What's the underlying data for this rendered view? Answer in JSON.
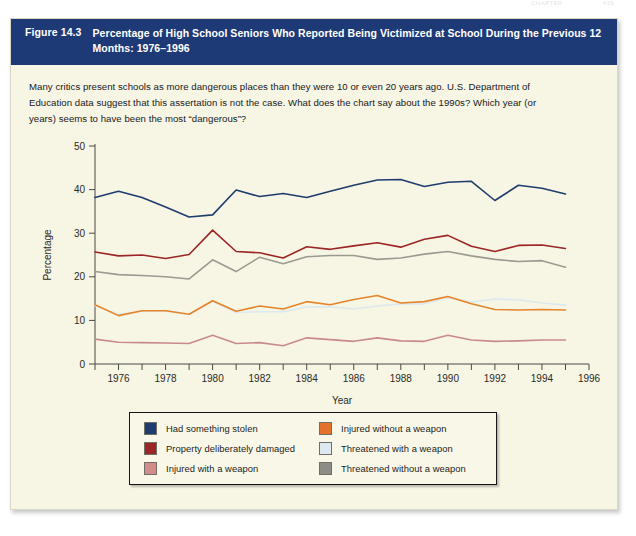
{
  "running_head": {
    "left_text": "CHAPTER",
    "right_text": "435"
  },
  "figure": {
    "number": "Figure 14.3",
    "title": "Percentage of High School Seniors Who Reported Being Victimized at School During the Previous 12 Months: 1976–1996",
    "caption": "Many critics present schools as more dangerous places than they were 10 or even 20 years ago. U.S. Department of Education data suggest that this assertation is not the case. What does the chart say about the 1990s? Which year (or years) seems to have been the most “dangerous”?",
    "header_bg": "#1d3a77",
    "page_bg": "#f7f5e4"
  },
  "chart_data": {
    "type": "line",
    "title": "Percentage of High School Seniors Who Reported Being Victimized at School During the Previous 12 Months: 1976–1996",
    "xlabel": "Year",
    "ylabel": "Percentage",
    "xlim": [
      1975,
      1996
    ],
    "ylim": [
      0,
      50
    ],
    "yticks": [
      0,
      10,
      20,
      30,
      40,
      50
    ],
    "xticks": [
      1975,
      1976,
      1977,
      1978,
      1979,
      1980,
      1981,
      1982,
      1983,
      1984,
      1985,
      1986,
      1987,
      1988,
      1989,
      1990,
      1991,
      1992,
      1993,
      1994,
      1995,
      1996
    ],
    "xtick_labels": [
      "1976",
      "1978",
      "1980",
      "1982",
      "1984",
      "1986",
      "1988",
      "1990",
      "1992",
      "1994",
      "1996"
    ],
    "grid": false,
    "legend_position": "bottom",
    "x": [
      1975,
      1976,
      1977,
      1978,
      1979,
      1980,
      1981,
      1982,
      1983,
      1984,
      1985,
      1986,
      1987,
      1988,
      1989,
      1990,
      1991,
      1992,
      1993,
      1994,
      1995
    ],
    "series": [
      {
        "name": "Had something stolen",
        "color": "#1e3c6e",
        "values": [
          38.2,
          39.6,
          38.2,
          36.0,
          33.7,
          34.2,
          39.9,
          38.4,
          39.1,
          38.2,
          39.6,
          41.0,
          42.2,
          42.3,
          40.7,
          41.7,
          41.9,
          37.5,
          41.0,
          40.3,
          39.0
        ]
      },
      {
        "name": "Property deliberately damaged",
        "color": "#9c2526",
        "values": [
          25.7,
          24.8,
          25.0,
          24.2,
          25.1,
          30.7,
          25.8,
          25.5,
          24.3,
          26.9,
          26.3,
          27.1,
          27.8,
          26.8,
          28.6,
          29.5,
          27.0,
          25.8,
          27.2,
          27.3,
          26.5
        ]
      },
      {
        "name": "Injured with a weapon",
        "color": "#c98a8a",
        "values": [
          5.7,
          5.0,
          4.9,
          4.8,
          4.7,
          6.6,
          4.7,
          4.9,
          4.2,
          6.0,
          5.6,
          5.2,
          6.0,
          5.3,
          5.2,
          6.6,
          5.5,
          5.2,
          5.3,
          5.5,
          5.5
        ]
      },
      {
        "name": "Injured without a weapon",
        "color": "#e5842a",
        "values": [
          13.6,
          11.1,
          12.2,
          12.2,
          11.4,
          14.5,
          12.1,
          13.3,
          12.6,
          14.3,
          13.6,
          14.8,
          15.7,
          14.0,
          14.3,
          15.5,
          13.8,
          12.5,
          12.4,
          12.5,
          12.4
        ]
      },
      {
        "name": "Threatened with a weapon",
        "color": "#dde9ee",
        "values": [
          13.4,
          11.4,
          12.1,
          12.2,
          11.4,
          14.4,
          11.8,
          12.0,
          12.0,
          13.1,
          13.1,
          12.6,
          13.3,
          13.8,
          13.8,
          15.2,
          14.2,
          14.9,
          14.7,
          14.0,
          13.5
        ]
      },
      {
        "name": "Threatened without a weapon",
        "color": "#9a9a90",
        "values": [
          21.2,
          20.5,
          20.3,
          20.0,
          19.5,
          23.9,
          21.2,
          24.5,
          23.0,
          24.6,
          24.9,
          24.9,
          24.0,
          24.3,
          25.2,
          25.8,
          24.8,
          24.0,
          23.5,
          23.7,
          22.2
        ]
      }
    ]
  },
  "legend": {
    "items": [
      {
        "label": "Had something stolen",
        "color": "#1e3c6e"
      },
      {
        "label": "Property deliberately damaged",
        "color": "#9c2526"
      },
      {
        "label": "Injured with a weapon",
        "color": "#d48b8b"
      },
      {
        "label": "Injured without a weapon",
        "color": "#e5722a"
      },
      {
        "label": "Threatened with a weapon",
        "color": "#dde9ee"
      },
      {
        "label": "Threatened without a weapon",
        "color": "#8d8d86"
      }
    ]
  }
}
